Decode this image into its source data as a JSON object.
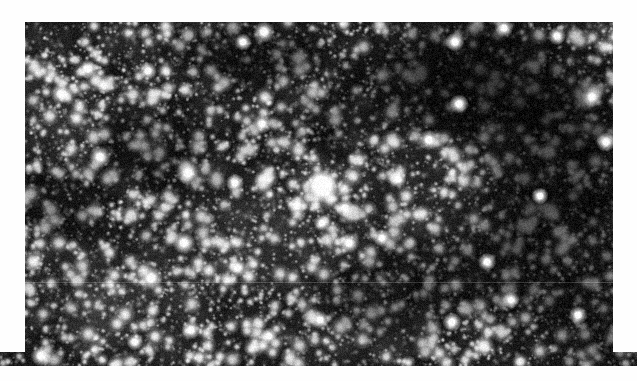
{
  "page": {
    "background_color": "#fefefe",
    "width": 637,
    "height": 381
  },
  "image_plate": {
    "name": "star-field-photograph",
    "description": "Dense Milky Way star field photographic plate, monochrome grayscale, with a prominent bright saturated star near the centre and dark obscuring dust lanes.",
    "frame": {
      "x": 25,
      "y": 22,
      "width": 588,
      "height": 344
    },
    "background_color": "#050505",
    "sky_base_color": "#161616",
    "star_color": "#ffffff",
    "star_count": 2600,
    "faint_star_count": 5200,
    "noise_opacity": 0.5,
    "seed": 20240917,
    "bottom_bleed": {
      "enabled": true,
      "x": 0,
      "y": 352,
      "width": 637,
      "height": 14,
      "note": "dark strip bleeding to the left page edge at the bottom of the plate"
    },
    "seam": {
      "enabled": true,
      "y": 282,
      "opacity": 0.18,
      "note": "faint horizontal plate/scan seam discontinuity"
    },
    "dark_lanes": [
      {
        "cx": 470,
        "cy": 80,
        "rx": 150,
        "ry": 75,
        "strength": 0.8
      },
      {
        "cx": 560,
        "cy": 150,
        "rx": 110,
        "ry": 90,
        "strength": 0.7
      },
      {
        "cx": 540,
        "cy": 250,
        "rx": 120,
        "ry": 90,
        "strength": 0.62
      },
      {
        "cx": 255,
        "cy": 52,
        "rx": 95,
        "ry": 42,
        "strength": 0.58
      },
      {
        "cx": 150,
        "cy": 150,
        "rx": 70,
        "ry": 55,
        "strength": 0.42
      },
      {
        "cx": 60,
        "cy": 205,
        "rx": 60,
        "ry": 45,
        "strength": 0.4
      },
      {
        "cx": 395,
        "cy": 300,
        "rx": 95,
        "ry": 60,
        "strength": 0.45
      },
      {
        "cx": 600,
        "cy": 330,
        "rx": 70,
        "ry": 55,
        "strength": 0.55
      },
      {
        "cx": 330,
        "cy": 120,
        "rx": 60,
        "ry": 40,
        "strength": 0.3
      }
    ],
    "bright_patches": [
      {
        "cx": 120,
        "cy": 300,
        "rx": 110,
        "ry": 70,
        "strength": 0.3
      },
      {
        "cx": 250,
        "cy": 230,
        "rx": 120,
        "ry": 80,
        "strength": 0.26
      },
      {
        "cx": 60,
        "cy": 110,
        "rx": 70,
        "ry": 60,
        "strength": 0.22
      },
      {
        "cx": 350,
        "cy": 330,
        "rx": 120,
        "ry": 50,
        "strength": 0.2
      },
      {
        "cx": 420,
        "cy": 190,
        "rx": 80,
        "ry": 60,
        "strength": 0.18
      }
    ],
    "primary_star": {
      "label": "bright-central-star",
      "x": 322,
      "y": 186,
      "core_radius": 8,
      "halo_radius": 34,
      "brightness": 1.0
    },
    "notable_stars": [
      {
        "x": 297,
        "y": 206,
        "r": 3.4
      },
      {
        "x": 345,
        "y": 208,
        "r": 3.2
      },
      {
        "x": 322,
        "y": 223,
        "r": 3.0
      },
      {
        "x": 349,
        "y": 243,
        "r": 3.6
      },
      {
        "x": 382,
        "y": 238,
        "r": 3.2
      },
      {
        "x": 184,
        "y": 243,
        "r": 4.0
      },
      {
        "x": 188,
        "y": 173,
        "r": 4.2
      },
      {
        "x": 100,
        "y": 157,
        "r": 3.8
      },
      {
        "x": 61,
        "y": 94,
        "r": 3.6
      },
      {
        "x": 88,
        "y": 69,
        "r": 3.4
      },
      {
        "x": 148,
        "y": 71,
        "r": 3.2
      },
      {
        "x": 264,
        "y": 32,
        "r": 3.8
      },
      {
        "x": 243,
        "y": 42,
        "r": 3.0
      },
      {
        "x": 455,
        "y": 42,
        "r": 3.4
      },
      {
        "x": 504,
        "y": 28,
        "r": 3.2
      },
      {
        "x": 557,
        "y": 36,
        "r": 3.2
      },
      {
        "x": 459,
        "y": 104,
        "r": 3.4
      },
      {
        "x": 592,
        "y": 97,
        "r": 3.6
      },
      {
        "x": 606,
        "y": 142,
        "r": 3.4
      },
      {
        "x": 429,
        "y": 140,
        "r": 3.6
      },
      {
        "x": 151,
        "y": 278,
        "r": 4.2
      },
      {
        "x": 238,
        "y": 268,
        "r": 3.2
      },
      {
        "x": 191,
        "y": 330,
        "r": 3.4
      },
      {
        "x": 269,
        "y": 336,
        "r": 3.0
      },
      {
        "x": 320,
        "y": 320,
        "r": 3.2
      },
      {
        "x": 452,
        "y": 322,
        "r": 3.4
      },
      {
        "x": 511,
        "y": 300,
        "r": 3.0
      },
      {
        "x": 578,
        "y": 315,
        "r": 3.2
      },
      {
        "x": 135,
        "y": 342,
        "r": 3.0
      },
      {
        "x": 41,
        "y": 356,
        "r": 3.6
      },
      {
        "x": 235,
        "y": 183,
        "r": 3.2
      },
      {
        "x": 262,
        "y": 124,
        "r": 3.4
      },
      {
        "x": 398,
        "y": 179,
        "r": 3.0
      },
      {
        "x": 540,
        "y": 196,
        "r": 3.0
      },
      {
        "x": 487,
        "y": 262,
        "r": 3.2
      }
    ]
  }
}
